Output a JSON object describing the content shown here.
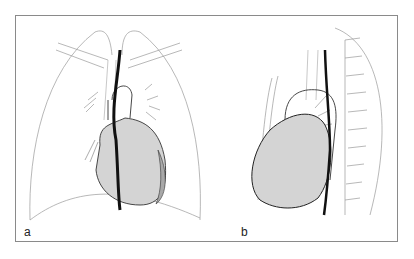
{
  "figure": {
    "panels": [
      {
        "label": "a",
        "view": "frontal chest view of heart, lungs, trachea and esophagus"
      },
      {
        "label": "b",
        "view": "lateral chest view of heart, aorta and esophagus"
      }
    ],
    "colors": {
      "border": "#8a8a8a",
      "outline": "#9a9a9a",
      "heart_fill": "#d4d4d4",
      "ventricle_shade": "#a8a8a8",
      "esophagus": "#111111"
    }
  }
}
